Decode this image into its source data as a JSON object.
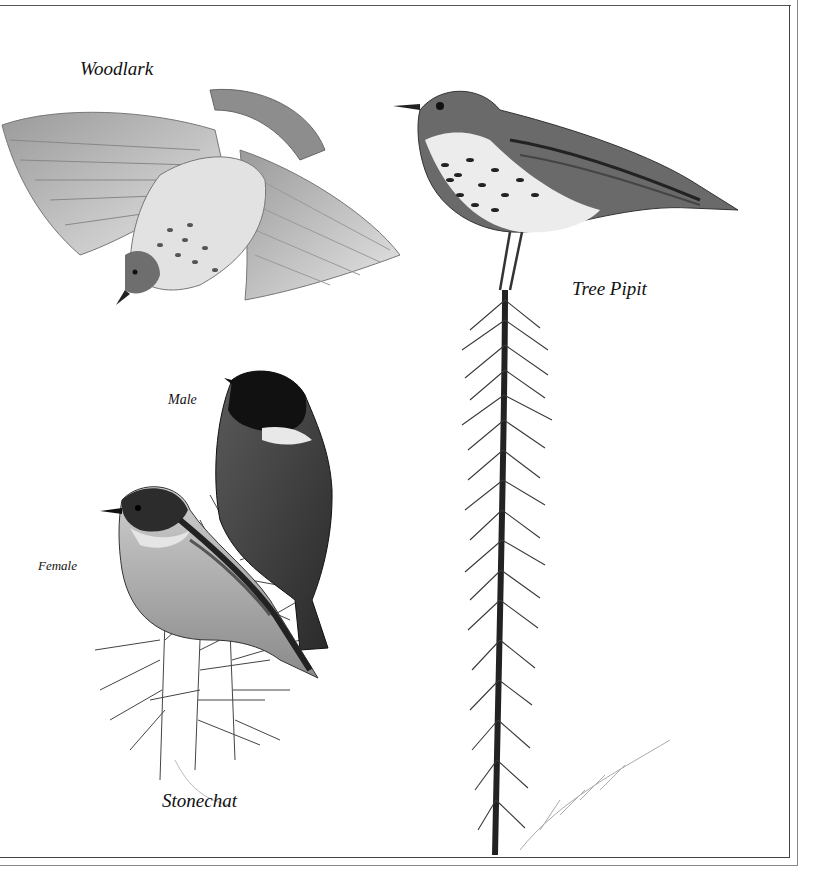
{
  "plate": {
    "labels": {
      "woodlark": "Woodlark",
      "tree_pipit": "Tree Pipit",
      "male": "Male",
      "female": "Female",
      "stonechat": "Stonechat"
    },
    "illustrations": [
      {
        "name": "woodlark",
        "pose": "flying, wings spread, diving"
      },
      {
        "name": "tree-pipit",
        "pose": "perched on top of conifer sprig"
      },
      {
        "name": "stonechat-male",
        "pose": "perched, back view, dark head"
      },
      {
        "name": "stonechat-female",
        "pose": "perched on gorse"
      }
    ],
    "colors": {
      "ink": "#111111",
      "frame": "#444444",
      "paper": "#ffffff"
    }
  }
}
